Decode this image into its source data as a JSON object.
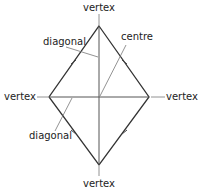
{
  "diagram": {
    "shape": "rhombus",
    "labels": {
      "vertex_top": "vertex",
      "vertex_left": "vertex",
      "vertex_right": "vertex",
      "vertex_bottom": "vertex",
      "diagonal_upper": "diagonal",
      "diagonal_lower": "diagonal",
      "centre": "centre"
    },
    "equal_sides_marked": true
  }
}
